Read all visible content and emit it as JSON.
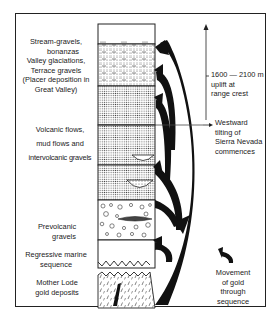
{
  "figure": {
    "colors": {
      "ink": "#1a1a1a",
      "background": "#ffffff",
      "stipple": "#555555"
    },
    "column": {
      "layers": [
        {
          "id": "top-blank",
          "name": "Surface"
        },
        {
          "id": "stream-gravels",
          "name": "Stream gravels / terrace gravels"
        },
        {
          "id": "volcanic-1",
          "name": "Volcanic flows unit 1"
        },
        {
          "id": "volcanic-2",
          "name": "Volcanic flows unit 2"
        },
        {
          "id": "volcanic-3",
          "name": "Volcanic flows unit 3"
        },
        {
          "id": "prevolcanic-gravels",
          "name": "Prevolcanic gravels"
        },
        {
          "id": "marine",
          "name": "Regressive marine sequence"
        },
        {
          "id": "mother-lode",
          "name": "Mother Lode gold deposits"
        }
      ]
    },
    "labels": {
      "stream": [
        "Stream-gravels,",
        "bonanzas",
        "Valley glaciations,",
        "Terrace gravels",
        "(Placer deposition in",
        "Great Valley)"
      ],
      "volcanic": [
        "Volcanic flows,",
        "mud flows and",
        "intervolcanic gravels"
      ],
      "prevolcanic": [
        "Prevolcanic",
        "gravels"
      ],
      "marine": [
        "Regressive marine",
        "sequence"
      ],
      "mother_lode": [
        "Mother Lode",
        "gold deposits"
      ],
      "uplift": [
        "1600 — 2100 m",
        "uplift at",
        "range crest"
      ],
      "tilting": [
        "Westward",
        "tilting of",
        "Sierra Nevada",
        "commences"
      ],
      "legend": [
        "Movement",
        "of gold",
        "through",
        "sequence"
      ]
    },
    "icons": {
      "uplift_arrow": "arrow-up-icon",
      "tilting_arrow": "arrow-right-icon",
      "legend_arrow": "curved-arrow-icon"
    }
  }
}
